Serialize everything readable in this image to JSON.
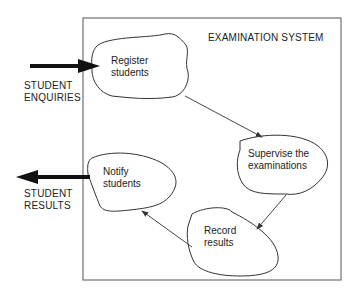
{
  "system": {
    "title": "EXAMINATION SYSTEM"
  },
  "external": {
    "input": {
      "line1": "STUDENT",
      "line2": "ENQUIRIES"
    },
    "output": {
      "line1": "STUDENT",
      "line2": "RESULTS"
    }
  },
  "processes": [
    {
      "line1": "Register",
      "line2": "students"
    },
    {
      "line1": "Supervise the",
      "line2": "examinations"
    },
    {
      "line1": "Record",
      "line2": "results"
    },
    {
      "line1": "Notify",
      "line2": "students"
    }
  ],
  "colors": {
    "stroke": "#333333",
    "background": "#ffffff"
  }
}
